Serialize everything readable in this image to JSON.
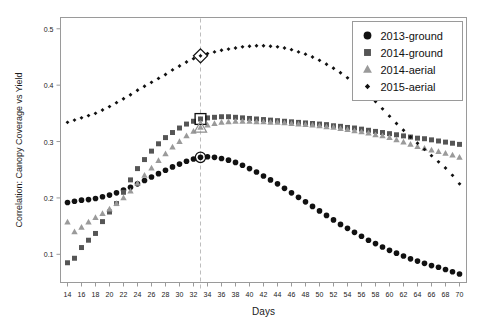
{
  "chart_data": {
    "type": "scatter",
    "title": "",
    "xlabel": "Days",
    "ylabel": "Correlation: Canopy Coverage vs Yield",
    "xlim": [
      13,
      71
    ],
    "ylim": [
      0.05,
      0.52
    ],
    "xticks": [
      14,
      16,
      18,
      20,
      22,
      24,
      26,
      28,
      30,
      32,
      34,
      36,
      38,
      40,
      42,
      44,
      46,
      48,
      50,
      52,
      54,
      56,
      58,
      60,
      62,
      64,
      66,
      68,
      70
    ],
    "yticks": [
      0.1,
      0.2,
      0.3,
      0.4,
      0.5
    ],
    "ytick_labels": [
      "0.1",
      "0.2",
      "0.3",
      "0.4",
      "0.5"
    ],
    "grid": false,
    "legend_position": "top-right",
    "annotation": {
      "type": "vertical-dashed-line",
      "x": 33,
      "label": "",
      "highlighted_points": [
        {
          "series": "2013-ground",
          "x": 33,
          "y": 0.272
        },
        {
          "series": "2014-ground",
          "x": 33,
          "y": 0.34
        },
        {
          "series": "2014-aerial",
          "x": 33,
          "y": 0.325
        },
        {
          "series": "2015-aerial",
          "x": 33,
          "y": 0.452
        }
      ]
    },
    "x": [
      14,
      15,
      16,
      17,
      18,
      19,
      20,
      21,
      22,
      23,
      24,
      25,
      26,
      27,
      28,
      29,
      30,
      31,
      32,
      33,
      34,
      35,
      36,
      37,
      38,
      39,
      40,
      41,
      42,
      43,
      44,
      45,
      46,
      47,
      48,
      49,
      50,
      51,
      52,
      53,
      54,
      55,
      56,
      57,
      58,
      59,
      60,
      61,
      62,
      63,
      64,
      65,
      66,
      67,
      68,
      69,
      70
    ],
    "series": [
      {
        "name": "2013-ground",
        "marker": "circle",
        "color": "#111111",
        "values": [
          0.192,
          0.194,
          0.196,
          0.197,
          0.199,
          0.202,
          0.205,
          0.209,
          0.214,
          0.219,
          0.225,
          0.231,
          0.237,
          0.243,
          0.249,
          0.255,
          0.26,
          0.265,
          0.269,
          0.272,
          0.273,
          0.272,
          0.27,
          0.267,
          0.263,
          0.258,
          0.252,
          0.246,
          0.239,
          0.232,
          0.225,
          0.217,
          0.209,
          0.201,
          0.193,
          0.185,
          0.177,
          0.169,
          0.161,
          0.153,
          0.146,
          0.139,
          0.132,
          0.125,
          0.119,
          0.113,
          0.107,
          0.102,
          0.097,
          0.092,
          0.088,
          0.084,
          0.08,
          0.077,
          0.073,
          0.069,
          0.065
        ]
      },
      {
        "name": "2014-ground",
        "marker": "square",
        "color": "#555555",
        "values": [
          0.085,
          0.093,
          0.112,
          0.125,
          0.137,
          0.158,
          0.175,
          0.19,
          0.21,
          0.232,
          0.252,
          0.268,
          0.283,
          0.296,
          0.307,
          0.316,
          0.324,
          0.331,
          0.336,
          0.34,
          0.342,
          0.343,
          0.344,
          0.344,
          0.343,
          0.342,
          0.341,
          0.34,
          0.339,
          0.338,
          0.337,
          0.336,
          0.335,
          0.334,
          0.333,
          0.332,
          0.331,
          0.33,
          0.328,
          0.327,
          0.325,
          0.324,
          0.322,
          0.32,
          0.318,
          0.316,
          0.314,
          0.312,
          0.31,
          0.308,
          0.306,
          0.305,
          0.303,
          0.301,
          0.299,
          0.297,
          0.295
        ]
      },
      {
        "name": "2014-aerial",
        "marker": "triangle",
        "color": "#9a9a9a",
        "values": [
          0.157,
          0.14,
          0.148,
          0.157,
          0.165,
          0.172,
          0.18,
          0.19,
          0.2,
          0.212,
          0.226,
          0.24,
          0.253,
          0.266,
          0.278,
          0.29,
          0.3,
          0.31,
          0.318,
          0.325,
          0.329,
          0.332,
          0.334,
          0.335,
          0.336,
          0.336,
          0.336,
          0.335,
          0.335,
          0.334,
          0.334,
          0.333,
          0.332,
          0.331,
          0.33,
          0.329,
          0.328,
          0.326,
          0.325,
          0.323,
          0.321,
          0.319,
          0.317,
          0.315,
          0.312,
          0.31,
          0.307,
          0.303,
          0.299,
          0.295,
          0.291,
          0.288,
          0.285,
          0.282,
          0.279,
          0.276,
          0.272
        ]
      },
      {
        "name": "2015-aerial",
        "marker": "diamond",
        "color": "#111111",
        "values": [
          0.334,
          0.338,
          0.342,
          0.346,
          0.35,
          0.356,
          0.362,
          0.369,
          0.376,
          0.383,
          0.391,
          0.398,
          0.405,
          0.412,
          0.419,
          0.427,
          0.434,
          0.441,
          0.447,
          0.452,
          0.456,
          0.459,
          0.462,
          0.464,
          0.466,
          0.468,
          0.469,
          0.47,
          0.47,
          0.469,
          0.468,
          0.466,
          0.463,
          0.459,
          0.455,
          0.45,
          0.444,
          0.437,
          0.43,
          0.422,
          0.413,
          0.404,
          0.394,
          0.383,
          0.371,
          0.358,
          0.345,
          0.332,
          0.32,
          0.308,
          0.297,
          0.286,
          0.275,
          0.264,
          0.253,
          0.24,
          0.225
        ]
      }
    ],
    "legend": [
      {
        "label": "2013-ground",
        "marker": "circle",
        "color": "#111111"
      },
      {
        "label": "2014-ground",
        "marker": "square",
        "color": "#555555"
      },
      {
        "label": "2014-aerial",
        "marker": "triangle",
        "color": "#9a9a9a"
      },
      {
        "label": "2015-aerial",
        "marker": "diamond",
        "color": "#111111"
      }
    ]
  }
}
